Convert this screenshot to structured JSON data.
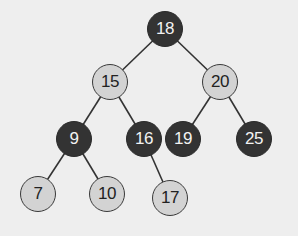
{
  "diagram": {
    "type": "red-black-tree",
    "colors": {
      "background": "#eeeeee",
      "black_node_fill": "#333333",
      "red_node_fill": "#d3d3d3",
      "edge": "#333333"
    },
    "nodes": [
      {
        "id": "n18",
        "label": "18",
        "color": "black",
        "x": 165,
        "y": 29
      },
      {
        "id": "n15",
        "label": "15",
        "color": "red",
        "x": 110,
        "y": 82
      },
      {
        "id": "n20",
        "label": "20",
        "color": "red",
        "x": 220,
        "y": 82
      },
      {
        "id": "n9",
        "label": "9",
        "color": "black",
        "x": 74,
        "y": 139
      },
      {
        "id": "n16",
        "label": "16",
        "color": "black",
        "x": 144,
        "y": 139
      },
      {
        "id": "n19",
        "label": "19",
        "color": "black",
        "x": 183,
        "y": 139
      },
      {
        "id": "n25",
        "label": "25",
        "color": "black",
        "x": 254,
        "y": 139
      },
      {
        "id": "n7",
        "label": "7",
        "color": "red",
        "x": 38,
        "y": 194
      },
      {
        "id": "n10",
        "label": "10",
        "color": "red",
        "x": 107,
        "y": 194
      },
      {
        "id": "n17",
        "label": "17",
        "color": "red",
        "x": 170,
        "y": 198
      }
    ],
    "edges": [
      {
        "from": "n18",
        "to": "n15"
      },
      {
        "from": "n18",
        "to": "n20"
      },
      {
        "from": "n15",
        "to": "n9"
      },
      {
        "from": "n15",
        "to": "n16"
      },
      {
        "from": "n20",
        "to": "n19"
      },
      {
        "from": "n20",
        "to": "n25"
      },
      {
        "from": "n9",
        "to": "n7"
      },
      {
        "from": "n9",
        "to": "n10"
      },
      {
        "from": "n16",
        "to": "n17"
      }
    ]
  }
}
